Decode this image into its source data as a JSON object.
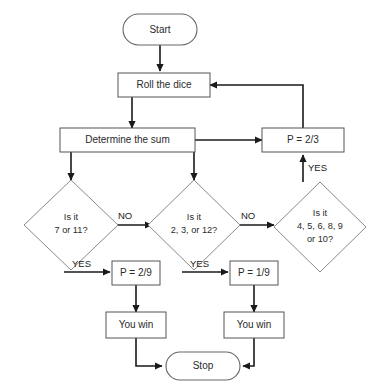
{
  "diagram": {
    "background_color": "#ffffff",
    "line_color": "#1a1a1a",
    "shape_stroke_color": "#6b6b6b",
    "text_color": "#2b2b2b",
    "nodes": {
      "start": {
        "label": "Start",
        "shape": "terminal"
      },
      "roll": {
        "label": "Roll the dice",
        "shape": "process"
      },
      "determine": {
        "label": "Determine the sum",
        "shape": "process"
      },
      "p_two_thirds": {
        "label": "P = 2/3",
        "shape": "process"
      },
      "decision_seven": {
        "label_line1": "Is it",
        "label_line2": "7 or 11?",
        "shape": "decision"
      },
      "decision_craps": {
        "label_line1": "Is it",
        "label_line2": "2, 3, or 12?",
        "shape": "decision"
      },
      "decision_point": {
        "label_line1": "Is it",
        "label_line2": "4, 5, 6, 8, 9",
        "label_line3": "or 10?",
        "shape": "decision"
      },
      "p_two_ninths": {
        "label": "P = 2/9",
        "shape": "process"
      },
      "p_one_ninth": {
        "label": "P = 1/9",
        "shape": "process"
      },
      "you_win_left": {
        "label": "You win",
        "shape": "process"
      },
      "you_win_right": {
        "label": "You win",
        "shape": "process"
      },
      "stop": {
        "label": "Stop",
        "shape": "terminal"
      }
    },
    "edge_labels": {
      "no_left": "NO",
      "no_middle": "NO",
      "yes_left": "YES",
      "yes_middle": "YES",
      "yes_right": "YES"
    }
  }
}
